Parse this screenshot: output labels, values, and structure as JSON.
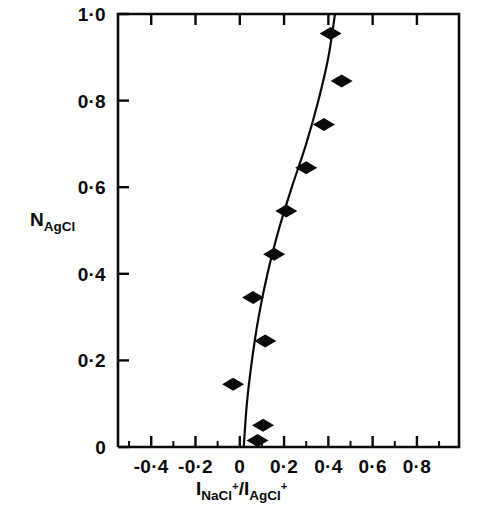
{
  "chart_data": {
    "type": "scatter",
    "title": "",
    "subtitle": "",
    "xlabel_parts": {
      "num_base": "I",
      "num_sub": "NaCl",
      "num_sup": "+",
      "separator": "/",
      "den_base": "I",
      "den_sub": "AgCl",
      "den_sup": "+"
    },
    "xlabel": "I_NaCl+ / I_AgCl+",
    "ylabel_parts": {
      "base": "N",
      "sub": "AgCl"
    },
    "ylabel": "N_AgCl",
    "xlim": [
      -0.55,
      0.99
    ],
    "ylim": [
      0.0,
      1.0
    ],
    "xticks_major": [
      -0.4,
      -0.2,
      0.0,
      0.2,
      0.4,
      0.6,
      0.8
    ],
    "xticklabels": [
      "-0·4",
      "-0·2",
      "0",
      "0·2",
      "0·4",
      "0·6",
      "0·8"
    ],
    "xticks_minor": [
      -0.5,
      -0.3,
      -0.1,
      0.1,
      0.3,
      0.5,
      0.7,
      0.9
    ],
    "yticks_major": [
      0.0,
      0.2,
      0.4,
      0.6,
      0.8,
      1.0
    ],
    "yticklabels": [
      "0",
      "0·2",
      "0·4",
      "0·6",
      "0·8",
      "1·0"
    ],
    "grid": false,
    "legend_position": "none",
    "marker_style": "filled-diamond",
    "marker_color": "#0a0a0a",
    "line_color": "#0a0a0a",
    "points": [
      {
        "x": 0.41,
        "y": 0.955
      },
      {
        "x": 0.46,
        "y": 0.845
      },
      {
        "x": 0.38,
        "y": 0.745
      },
      {
        "x": 0.3,
        "y": 0.645
      },
      {
        "x": 0.21,
        "y": 0.545
      },
      {
        "x": 0.155,
        "y": 0.445
      },
      {
        "x": 0.06,
        "y": 0.345
      },
      {
        "x": 0.115,
        "y": 0.245
      },
      {
        "x": -0.03,
        "y": 0.145
      },
      {
        "x": 0.105,
        "y": 0.05
      },
      {
        "x": 0.08,
        "y": 0.015
      }
    ],
    "fit_curve": [
      {
        "x": 0.43,
        "y": 1.0
      },
      {
        "x": 0.4,
        "y": 0.9
      },
      {
        "x": 0.355,
        "y": 0.8
      },
      {
        "x": 0.3,
        "y": 0.7
      },
      {
        "x": 0.235,
        "y": 0.6
      },
      {
        "x": 0.175,
        "y": 0.5
      },
      {
        "x": 0.125,
        "y": 0.4
      },
      {
        "x": 0.085,
        "y": 0.3
      },
      {
        "x": 0.055,
        "y": 0.2
      },
      {
        "x": 0.032,
        "y": 0.1
      },
      {
        "x": 0.018,
        "y": 0.0
      }
    ]
  },
  "axes_geometry": {
    "plot_left_px": 118,
    "plot_right_px": 459,
    "plot_top_px": 14,
    "plot_bottom_px": 447
  }
}
